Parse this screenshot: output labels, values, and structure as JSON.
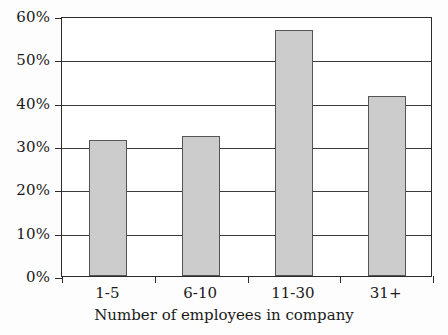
{
  "chart_data": {
    "type": "bar",
    "title": "",
    "subtitle": "",
    "xlabel": "Number of employees in company",
    "ylabel": "",
    "categories": [
      "1-5",
      "6-10",
      "11-30",
      "31+"
    ],
    "values": [
      31.5,
      32.2,
      56.7,
      41.5
    ],
    "value_labels": [
      "31.5%",
      "32.2%",
      "56.7%",
      "41.5%"
    ],
    "series": [
      {
        "name": "Percentage",
        "values": [
          31.5,
          32.2,
          56.7,
          41.5
        ]
      }
    ],
    "ylim": [
      0,
      60
    ],
    "ytick_values": [
      0,
      10,
      20,
      30,
      40,
      50,
      60
    ],
    "ytick_labels": [
      "0%",
      "10%",
      "20%",
      "30%",
      "40%",
      "50%",
      "60%"
    ],
    "grid": true,
    "grid_axis": "y",
    "legend": false,
    "legend_position": "none",
    "colors": {
      "bar_fill": "#cccccc",
      "bar_stroke": "#555555",
      "axis": "#2b2b2b",
      "grid": "#3a3a3a",
      "text": "#1a1a1a",
      "background": "#ffffff"
    }
  }
}
